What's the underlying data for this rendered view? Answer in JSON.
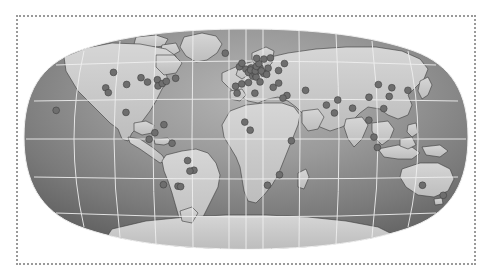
{
  "figure": {
    "kind": "world-map-distribution",
    "projection": "Robinson",
    "title": "",
    "caption": "",
    "frame": {
      "style": "dotted",
      "color": "#9a9a9a",
      "width_px": 460,
      "height_px": 250
    }
  },
  "map_style": {
    "ocean_fill_center": "#9a9a9a",
    "ocean_fill_edge": "#5f5f5f",
    "land_fill": "#c9c9c9",
    "coastline_color": "#3a3a3a",
    "graticule_color": "#eeeeee",
    "background": "#ffffff",
    "marker_fill": "#6e6e6e",
    "marker_stroke": "#3c3c3c",
    "marker_radius_px": 3.4
  },
  "graticule": {
    "visible": true,
    "parallels_deg": [
      60,
      30,
      0,
      -30,
      -60
    ],
    "meridians_deg": [
      -150,
      -120,
      -90,
      -60,
      -30,
      0,
      30,
      60,
      90,
      120,
      150
    ],
    "outline": true
  },
  "chart_data": {
    "type": "scatter",
    "title": "",
    "xlabel": "Longitude",
    "ylabel": "Latitude",
    "xlim": [
      -180,
      180
    ],
    "ylim": [
      -90,
      90
    ],
    "grid": true,
    "legend": "none",
    "series": [
      {
        "name": "Sites",
        "marker": "circle",
        "color": "#6e6e6e",
        "count": 67,
        "points": [
          {
            "region": "Pacific / Hawaii",
            "lon": -157.0,
            "lat": 21.0
          },
          {
            "region": "North America",
            "lon": -123.0,
            "lat": 49.0
          },
          {
            "region": "North America",
            "lon": -122.0,
            "lat": 37.5
          },
          {
            "region": "North America",
            "lon": -118.0,
            "lat": 34.0
          },
          {
            "region": "North America",
            "lon": -105.0,
            "lat": 40.0
          },
          {
            "region": "North America",
            "lon": -99.0,
            "lat": 19.5
          },
          {
            "region": "North America",
            "lon": -95.0,
            "lat": 45.0
          },
          {
            "region": "North America",
            "lon": -87.5,
            "lat": 41.8
          },
          {
            "region": "North America",
            "lon": -79.5,
            "lat": 43.5
          },
          {
            "region": "North America",
            "lon": -77.0,
            "lat": 38.9
          },
          {
            "region": "North America",
            "lon": -73.9,
            "lat": 40.7
          },
          {
            "region": "North America",
            "lon": -71.0,
            "lat": 42.3
          },
          {
            "region": "North America",
            "lon": -63.5,
            "lat": 44.6
          },
          {
            "region": "South America",
            "lon": -74.0,
            "lat": 4.6
          },
          {
            "region": "South America",
            "lon": -78.5,
            "lat": -0.2
          },
          {
            "region": "South America",
            "lon": -66.9,
            "lat": 10.5
          },
          {
            "region": "South America",
            "lon": -60.0,
            "lat": -3.1
          },
          {
            "region": "South America",
            "lon": -47.9,
            "lat": -15.8
          },
          {
            "region": "South America",
            "lon": -43.2,
            "lat": -22.9
          },
          {
            "region": "South America",
            "lon": -46.6,
            "lat": -23.5
          },
          {
            "region": "South America",
            "lon": -58.4,
            "lat": -34.6
          },
          {
            "region": "South America",
            "lon": -56.2,
            "lat": -34.9
          },
          {
            "region": "South America",
            "lon": -70.6,
            "lat": -33.5
          },
          {
            "region": "Europe",
            "lon": -21.9,
            "lat": 64.1
          },
          {
            "region": "Europe",
            "lon": -9.1,
            "lat": 38.7
          },
          {
            "region": "Europe",
            "lon": -3.7,
            "lat": 40.4
          },
          {
            "region": "Europe",
            "lon": -0.1,
            "lat": 51.5
          },
          {
            "region": "Europe",
            "lon": -6.3,
            "lat": 53.3
          },
          {
            "region": "Europe",
            "lon": -4.0,
            "lat": 56.0
          },
          {
            "region": "Europe",
            "lon": 2.3,
            "lat": 48.9
          },
          {
            "region": "Europe",
            "lon": 2.2,
            "lat": 41.4
          },
          {
            "region": "Europe",
            "lon": 4.9,
            "lat": 52.4
          },
          {
            "region": "Europe",
            "lon": 4.4,
            "lat": 50.8
          },
          {
            "region": "Europe",
            "lon": 6.1,
            "lat": 46.2
          },
          {
            "region": "Europe",
            "lon": 8.5,
            "lat": 47.4
          },
          {
            "region": "Europe",
            "lon": 9.2,
            "lat": 45.5
          },
          {
            "region": "Europe",
            "lon": 12.5,
            "lat": 41.9
          },
          {
            "region": "Europe",
            "lon": 8.7,
            "lat": 50.1
          },
          {
            "region": "Europe",
            "lon": 13.4,
            "lat": 52.5
          },
          {
            "region": "Europe",
            "lon": 10.0,
            "lat": 53.6
          },
          {
            "region": "Europe",
            "lon": 12.6,
            "lat": 55.7
          },
          {
            "region": "Europe",
            "lon": 10.8,
            "lat": 59.9
          },
          {
            "region": "Europe",
            "lon": 18.1,
            "lat": 59.3
          },
          {
            "region": "Europe",
            "lon": 24.9,
            "lat": 60.2
          },
          {
            "region": "Europe",
            "lon": 16.4,
            "lat": 48.2
          },
          {
            "region": "Europe",
            "lon": 14.4,
            "lat": 50.1
          },
          {
            "region": "Europe",
            "lon": 21.0,
            "lat": 52.2
          },
          {
            "region": "Europe",
            "lon": 19.0,
            "lat": 47.5
          },
          {
            "region": "Europe",
            "lon": 23.7,
            "lat": 37.9
          },
          {
            "region": "Europe",
            "lon": 28.9,
            "lat": 41.0
          },
          {
            "region": "Europe",
            "lon": 30.5,
            "lat": 50.4
          },
          {
            "region": "Europe",
            "lon": 37.6,
            "lat": 55.8
          },
          {
            "region": "Middle East",
            "lon": 34.8,
            "lat": 31.9
          },
          {
            "region": "Middle East",
            "lon": 51.4,
            "lat": 35.7
          },
          {
            "region": "Africa",
            "lon": 7.6,
            "lat": 33.6
          },
          {
            "region": "Africa",
            "lon": -7.6,
            "lat": 33.6
          },
          {
            "region": "Africa",
            "lon": 3.4,
            "lat": 6.5
          },
          {
            "region": "Africa",
            "lon": -1.0,
            "lat": 12.4
          },
          {
            "region": "Africa",
            "lon": 31.2,
            "lat": 30.0
          },
          {
            "region": "Africa",
            "lon": 36.8,
            "lat": -1.3
          },
          {
            "region": "Africa",
            "lon": 28.0,
            "lat": -26.2
          },
          {
            "region": "Africa",
            "lon": 18.4,
            "lat": -33.9
          },
          {
            "region": "Asia",
            "lon": 77.2,
            "lat": 28.6
          },
          {
            "region": "Asia",
            "lon": 72.9,
            "lat": 19.1
          },
          {
            "region": "Asia",
            "lon": 67.0,
            "lat": 24.9
          },
          {
            "region": "Asia",
            "lon": 88.4,
            "lat": 22.6
          },
          {
            "region": "Asia",
            "lon": 100.5,
            "lat": 13.8
          },
          {
            "region": "Asia",
            "lon": 103.8,
            "lat": 1.4
          },
          {
            "region": "Asia",
            "lon": 106.8,
            "lat": -6.2
          },
          {
            "region": "Asia",
            "lon": 116.4,
            "lat": 39.9
          },
          {
            "region": "Asia",
            "lon": 121.5,
            "lat": 31.2
          },
          {
            "region": "Asia",
            "lon": 114.2,
            "lat": 22.3
          },
          {
            "region": "Asia",
            "lon": 126.9,
            "lat": 37.6
          },
          {
            "region": "Asia",
            "lon": 139.7,
            "lat": 35.7
          },
          {
            "region": "Asia",
            "lon": 104.1,
            "lat": 30.6
          },
          {
            "region": "Oceania",
            "lon": 151.2,
            "lat": -33.9
          },
          {
            "region": "Oceania",
            "lon": 174.8,
            "lat": -41.3
          }
        ]
      }
    ]
  }
}
